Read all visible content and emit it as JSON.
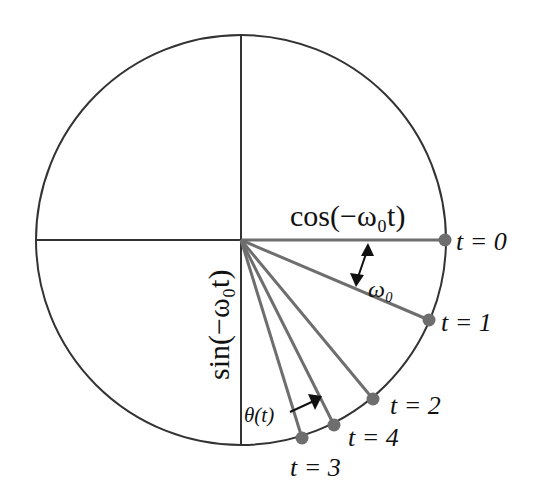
{
  "diagram": {
    "labels": {
      "cos": "cos(−ω₀t)",
      "sin": "sin(−ω₀t)",
      "omega": "ω₀",
      "theta": "θ(t)"
    },
    "points": [
      {
        "label": "t = 0"
      },
      {
        "label": "t = 1"
      },
      {
        "label": "t = 2"
      },
      {
        "label": "t = 4"
      },
      {
        "label": "t = 3"
      }
    ],
    "colors": {
      "circle": "#333333",
      "spoke": "#6e6e6e",
      "dot": "#6e6e6e"
    }
  }
}
